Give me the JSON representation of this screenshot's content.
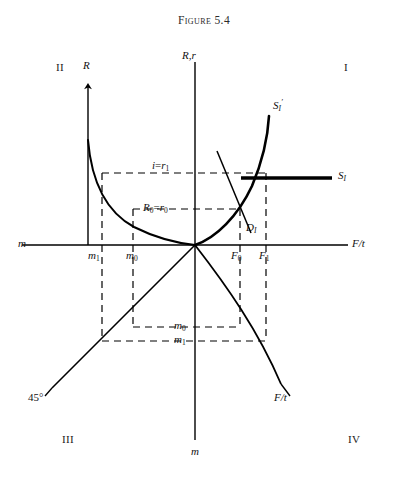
{
  "figure": {
    "title": "Figure 5.4",
    "domain_note": "Four-quadrant monetary/loanable-funds diagram"
  },
  "quadrants": [
    {
      "id": "I",
      "label": "I",
      "x": 344,
      "y": 68
    },
    {
      "id": "II",
      "label": "II",
      "x": 56,
      "y": 68
    },
    {
      "id": "III",
      "label": "III",
      "x": 62,
      "y": 440
    },
    {
      "id": "IV",
      "label": "IV",
      "x": 350,
      "y": 440
    }
  ],
  "axis_labels": {
    "vertical_top": "R,r",
    "vertical_bottom": "m",
    "horizontal_left": "m",
    "horizontal_right": "F/t",
    "quadrant2_vertical": "R",
    "quadrant4_diagonal": "F/t",
    "angle_marker": "45°"
  },
  "curves": [
    {
      "name": "S_I",
      "label": "S",
      "subscript": "I",
      "prime": "",
      "label_x": 340,
      "label_y": 178,
      "style": "thick-horizontal"
    },
    {
      "name": "S_I_prime",
      "label": "S",
      "subscript": "I",
      "prime": "′",
      "label_x": 276,
      "label_y": 106,
      "style": "rising"
    },
    {
      "name": "D_I",
      "label": "D",
      "subscript": "I",
      "prime": "",
      "label_x": 249,
      "label_y": 228,
      "style": "falling"
    }
  ],
  "rate_levels": [
    {
      "name": "i_equals_r1",
      "text_main": "i",
      "text_eq": "=",
      "text_sub_var": "r",
      "text_sub_idx": "1",
      "y": 168,
      "label_x": 152
    },
    {
      "name": "R0_equals_r0",
      "text_main": "R",
      "text_main_idx": "0",
      "text_eq": "=",
      "text_sub_var": "r",
      "text_sub_idx": "0",
      "y": 210,
      "label_x": 146
    }
  ],
  "money_ticks": [
    {
      "name": "m1",
      "var": "m",
      "idx": "1",
      "x": 90,
      "y": 258
    },
    {
      "name": "m0",
      "var": "m",
      "idx": "0",
      "x": 128,
      "y": 258
    }
  ],
  "money_levels_lower": [
    {
      "name": "m0-lower",
      "var": "m",
      "idx": "0",
      "x": 176,
      "y": 323
    },
    {
      "name": "m1-lower",
      "var": "m",
      "idx": "1",
      "x": 176,
      "y": 337
    }
  ],
  "funds_ticks": [
    {
      "name": "F0",
      "var": "F",
      "idx": "0",
      "x": 233,
      "y": 258
    },
    {
      "name": "F1",
      "var": "F",
      "idx": "1",
      "x": 261,
      "y": 258
    }
  ],
  "colors": {
    "ink": "#000000",
    "title": "#2b2b2b",
    "background": "#ffffff"
  },
  "geometry": {
    "origin_x": 195,
    "origin_y": 245,
    "m1_x": 102,
    "m0_x": 133,
    "r1_y": 173,
    "r0_y": 209,
    "F0_x": 240,
    "F1_x": 268,
    "lower_m0_y": 327,
    "lower_m1_y": 341
  }
}
